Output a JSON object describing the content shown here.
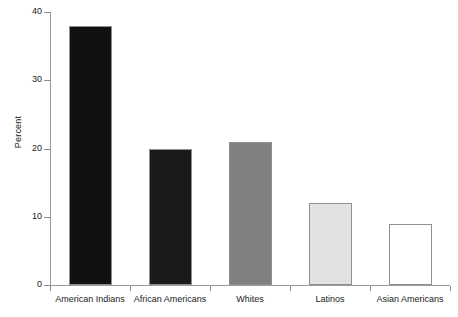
{
  "chart_data": {
    "type": "bar",
    "title": "",
    "xlabel": "",
    "ylabel": "Percent",
    "categories": [
      "American Indians",
      "African Americans",
      "Whites",
      "Latinos",
      "Asian Americans"
    ],
    "values": [
      38,
      20,
      21,
      12,
      9
    ],
    "bar_colors": [
      "#111111",
      "#1a1a1a",
      "#808080",
      "#e2e2e2",
      "#ffffff"
    ],
    "bar_border_color": "#8f8f8f",
    "ylim": [
      0,
      40
    ],
    "y_ticks": [
      0,
      10,
      20,
      30,
      40
    ],
    "y_tick_labels": [
      "0",
      "10",
      "20",
      "30",
      "40"
    ],
    "grid": false,
    "legend": "none",
    "axis_color": "#9a9a9a",
    "background": "#ffffff"
  },
  "axes": {
    "y_title": "Percent"
  }
}
